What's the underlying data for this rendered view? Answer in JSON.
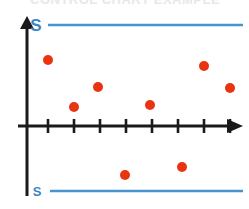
{
  "figure": {
    "width": 249,
    "height": 209,
    "background": "#ffffff",
    "title_fragment": "CONTROL CHART EXAMPLE"
  },
  "colors": {
    "axis": "#1a1a1a",
    "point": "#ea3311",
    "control_line": "#4a94cd",
    "label": "#3d86c6",
    "title_fragment": "#e8e8e8"
  },
  "axes": {
    "y_axis": {
      "x": 27,
      "y_top": 16,
      "y_bottom": 196,
      "arrow": "up"
    },
    "x_axis": {
      "y": 126,
      "x_left": 18,
      "x_right": 243,
      "arrow": "right"
    },
    "tick_count": 8,
    "tick_positions_px": [
      48,
      74,
      100,
      126,
      152,
      178,
      204,
      230
    ],
    "tick_half_length": 7
  },
  "control_limits": [
    {
      "name": "upper-control-limit",
      "label": "S",
      "label_size": 17,
      "label_x": 36,
      "label_y": 31,
      "y": 25,
      "x_start": 48,
      "x_end": 243
    },
    {
      "name": "lower-control-limit",
      "label": "S",
      "label_size": 13,
      "label_x": 37,
      "label_y": 196,
      "y": 191,
      "x_start": 50,
      "x_end": 243
    }
  ],
  "chart_data": {
    "type": "scatter",
    "title": "",
    "xlabel": "",
    "ylabel": "",
    "grid": false,
    "legend": null,
    "axis_style": "arrowed-number-line",
    "point_radius_px": 5,
    "point_color": "#ea3311",
    "reference_lines": [
      {
        "label": "S",
        "y_px": 25,
        "role": "upper-limit",
        "color": "#4a94cd"
      },
      {
        "label": "S",
        "y_px": 191,
        "role": "lower-limit",
        "color": "#4a94cd"
      }
    ],
    "baseline_y_px": 126,
    "series": [
      {
        "name": "samples",
        "points_px": [
          {
            "x": 48,
            "y": 60
          },
          {
            "x": 74,
            "y": 107
          },
          {
            "x": 98,
            "y": 87
          },
          {
            "x": 125,
            "y": 175
          },
          {
            "x": 150,
            "y": 105
          },
          {
            "x": 182,
            "y": 167
          },
          {
            "x": 204,
            "y": 66
          },
          {
            "x": 230,
            "y": 88
          }
        ],
        "x": [
          1,
          2,
          3,
          4,
          5,
          6,
          7,
          8
        ],
        "values": [
          0.79,
          0.23,
          0.47,
          -0.59,
          0.25,
          -0.49,
          0.72,
          0.46
        ]
      }
    ],
    "ylim": [
      -1,
      1
    ],
    "xlim": [
      0,
      9
    ]
  }
}
